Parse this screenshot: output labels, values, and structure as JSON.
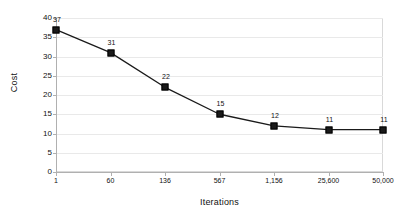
{
  "chart_data": {
    "type": "line",
    "title": "",
    "xlabel": "Iterations",
    "ylabel": "Cost",
    "categories": [
      "1",
      "60",
      "136",
      "567",
      "1,156",
      "25,600",
      "50,000"
    ],
    "values": [
      37,
      31,
      22,
      15,
      12,
      11,
      11
    ],
    "point_labels": [
      "37",
      "31",
      "22",
      "15",
      "12",
      "11",
      "11"
    ],
    "yticks": [
      "40",
      "35",
      "30",
      "25",
      "20",
      "15",
      "10",
      "5",
      "0"
    ],
    "ylim": [
      0,
      40
    ],
    "grid": true,
    "legend": "none",
    "series_color": "#1a1a1a",
    "gridline_color": "#e9e9e9",
    "axis_color": "#b0b0b0",
    "marker": "square"
  }
}
